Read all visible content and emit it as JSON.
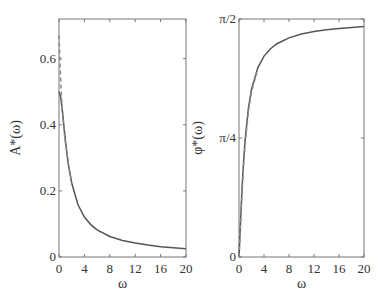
{
  "colors": {
    "axis": "#777777",
    "curve": "#555555",
    "dashed": "#888888",
    "text": "#333333"
  },
  "chart_data": [
    {
      "type": "line",
      "title": "",
      "xlabel": "ω",
      "ylabel": "A*(ω)",
      "xlim": [
        0,
        20
      ],
      "ylim": [
        0,
        0.72
      ],
      "xticks": [
        0,
        4,
        8,
        12,
        16,
        20
      ],
      "xtick_labels": [
        "0",
        "4",
        "8",
        "12",
        "16",
        "20"
      ],
      "yticks": [
        0,
        0.2,
        0.4,
        0.6
      ],
      "ytick_labels": [
        "0",
        "0.2",
        "0.4",
        "0.6"
      ],
      "grid": false,
      "legend": null,
      "series": [
        {
          "name": "solid",
          "style": "solid",
          "x": [
            0,
            0.25,
            0.5,
            0.75,
            1,
            1.5,
            2,
            3,
            4,
            5,
            6,
            8,
            10,
            12,
            14,
            16,
            18,
            20
          ],
          "y": [
            0.5,
            0.485,
            0.447,
            0.4,
            0.354,
            0.277,
            0.224,
            0.158,
            0.121,
            0.098,
            0.082,
            0.062,
            0.05,
            0.042,
            0.036,
            0.031,
            0.028,
            0.025
          ]
        },
        {
          "name": "dashed",
          "style": "dashed",
          "x": [
            0,
            0.1,
            0.2,
            0.35,
            0.5,
            0.75,
            1,
            1.5,
            2
          ],
          "y": [
            0.67,
            0.62,
            0.56,
            0.5,
            0.45,
            0.39,
            0.35,
            0.277,
            0.224
          ]
        }
      ]
    },
    {
      "type": "line",
      "title": "",
      "xlabel": "ω",
      "ylabel": "φ*(ω)",
      "xlim": [
        0,
        20
      ],
      "ylim": [
        0,
        1.5708
      ],
      "xticks": [
        0,
        4,
        8,
        12,
        16,
        20
      ],
      "xtick_labels": [
        "0",
        "4",
        "8",
        "12",
        "16",
        "20"
      ],
      "yticks": [
        0,
        0.7854,
        1.5708
      ],
      "ytick_labels": [
        "0",
        "π/4",
        "π/2"
      ],
      "grid": false,
      "legend": null,
      "series": [
        {
          "name": "solid",
          "style": "solid",
          "x": [
            0,
            0.25,
            0.5,
            0.75,
            1,
            1.5,
            2,
            3,
            4,
            5,
            6,
            8,
            10,
            12,
            14,
            16,
            18,
            20
          ],
          "y": [
            0,
            0.245,
            0.464,
            0.644,
            0.785,
            0.983,
            1.107,
            1.249,
            1.326,
            1.373,
            1.406,
            1.446,
            1.471,
            1.488,
            1.5,
            1.508,
            1.515,
            1.521
          ]
        },
        {
          "name": "dashed",
          "style": "dashed",
          "x": [
            0,
            0.25,
            0.5,
            0.75,
            1,
            1.5,
            2,
            3
          ],
          "y": [
            0,
            0.22,
            0.43,
            0.62,
            0.76,
            0.96,
            1.09,
            1.24
          ]
        }
      ]
    }
  ]
}
